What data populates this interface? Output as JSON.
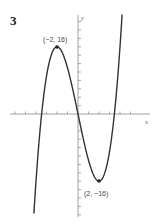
{
  "figure": {
    "number": "3",
    "x_axis_label": "x",
    "y_axis_label": "y",
    "max_label": "(−2, 16)",
    "min_label": "(2, −16)"
  },
  "colors": {
    "curve": "#333333",
    "axis": "#777777",
    "text": "#333333"
  },
  "chart_data": {
    "type": "line",
    "title": "3",
    "function": "y = x^3 - 12x",
    "xlabel": "x",
    "ylabel": "y",
    "xlim": [
      -6.5,
      6.8
    ],
    "ylim": [
      -24,
      23
    ],
    "grid": false,
    "x_tick_step": 1,
    "y_tick_step": 2,
    "series": [
      {
        "name": "y = x^3 - 12x",
        "x": [
          -4.2,
          -4,
          -3.5,
          -3,
          -2.5,
          -2,
          -1.5,
          -1,
          -0.5,
          0,
          0.5,
          1,
          1.5,
          2,
          2.5,
          3,
          3.5,
          4,
          4.2
        ],
        "y": [
          -23.7,
          -16,
          -0.9,
          9,
          14.4,
          16,
          14.6,
          11,
          5.9,
          0,
          -5.9,
          -11,
          -14.6,
          -16,
          -14.4,
          -9,
          0.9,
          16,
          23.7
        ]
      }
    ],
    "annotations": [
      {
        "label": "(−2, 16)",
        "x": -2,
        "y": 16,
        "kind": "local maximum"
      },
      {
        "label": "(2, −16)",
        "x": 2,
        "y": -16,
        "kind": "local minimum"
      }
    ]
  }
}
